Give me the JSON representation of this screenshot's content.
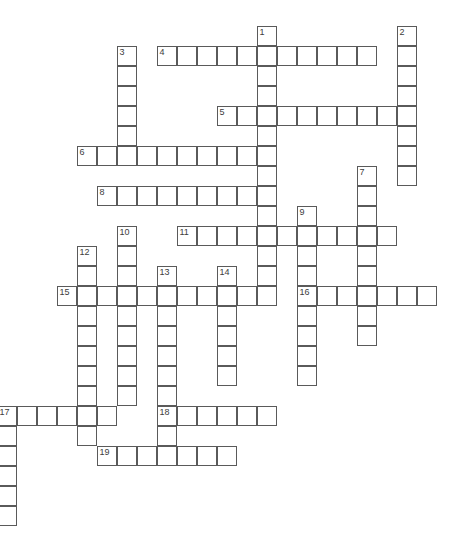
{
  "puzzle": {
    "type": "crossword",
    "cell_size": 20,
    "origin_x": -3.5,
    "origin_y": 26,
    "colors": {
      "border": "#5a5a5a",
      "number": "#3c3c3c",
      "background": "#ffffff"
    },
    "entries": [
      {
        "number": "1",
        "direction": "down",
        "row": 0,
        "col": 13,
        "length": 14
      },
      {
        "number": "2",
        "direction": "down",
        "row": 0,
        "col": 20,
        "length": 8
      },
      {
        "number": "3",
        "direction": "down",
        "row": 1,
        "col": 6,
        "length": 6
      },
      {
        "number": "4",
        "direction": "across",
        "row": 1,
        "col": 8,
        "length": 11
      },
      {
        "number": "5",
        "direction": "across",
        "row": 4,
        "col": 11,
        "length": 10
      },
      {
        "number": "6",
        "direction": "across",
        "row": 6,
        "col": 4,
        "length": 10
      },
      {
        "number": "7",
        "direction": "down",
        "row": 7,
        "col": 18,
        "length": 9
      },
      {
        "number": "8",
        "direction": "across",
        "row": 8,
        "col": 5,
        "length": 9
      },
      {
        "number": "9",
        "direction": "down",
        "row": 9,
        "col": 15,
        "length": 9
      },
      {
        "number": "10",
        "direction": "down",
        "row": 10,
        "col": 6,
        "length": 9
      },
      {
        "number": "11",
        "direction": "across",
        "row": 10,
        "col": 9,
        "length": 11
      },
      {
        "number": "12",
        "direction": "down",
        "row": 11,
        "col": 4,
        "length": 10
      },
      {
        "number": "13",
        "direction": "down",
        "row": 12,
        "col": 8,
        "length": 10
      },
      {
        "number": "14",
        "direction": "down",
        "row": 12,
        "col": 11,
        "length": 6
      },
      {
        "number": "15",
        "direction": "across",
        "row": 13,
        "col": 3,
        "length": 11
      },
      {
        "number": "16",
        "direction": "across",
        "row": 13,
        "col": 15,
        "length": 7
      },
      {
        "number": "17",
        "direction": "across",
        "row": 19,
        "col": 0,
        "length": 6
      },
      {
        "number": "17",
        "direction": "down",
        "row": 19,
        "col": 0,
        "length": 6
      },
      {
        "number": "18",
        "direction": "across",
        "row": 19,
        "col": 8,
        "length": 6
      },
      {
        "number": "19",
        "direction": "across",
        "row": 21,
        "col": 5,
        "length": 7
      }
    ]
  }
}
